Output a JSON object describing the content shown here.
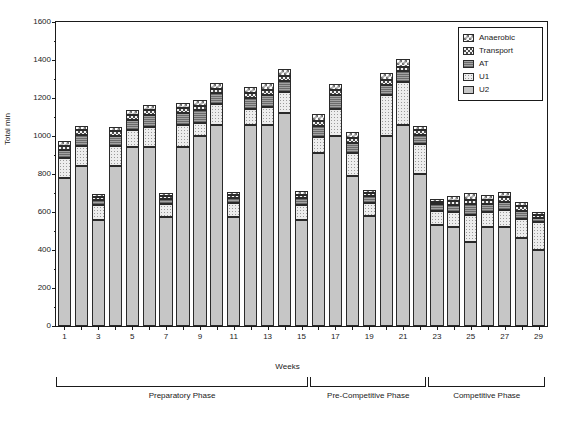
{
  "chart_data": {
    "type": "bar",
    "stacked": true,
    "title": "",
    "xlabel": "Weeks",
    "ylabel": "Total min",
    "ylim": [
      0,
      1600
    ],
    "ytick_step": 200,
    "yticks": [
      0,
      200,
      400,
      600,
      800,
      1000,
      1200,
      1400,
      1600
    ],
    "grid": false,
    "legend_position": "top-right",
    "categories": [
      1,
      2,
      3,
      4,
      5,
      6,
      7,
      8,
      9,
      10,
      11,
      12,
      13,
      14,
      15,
      16,
      17,
      18,
      19,
      20,
      21,
      22,
      23,
      24,
      25,
      26,
      27,
      28,
      29
    ],
    "xtick_labels": [
      "1",
      "3",
      "5",
      "7",
      "9",
      "11",
      "13",
      "15",
      "17",
      "19",
      "21",
      "23",
      "25",
      "27",
      "29"
    ],
    "series": [
      {
        "name": "U2",
        "values": [
          780,
          840,
          560,
          840,
          940,
          940,
          575,
          940,
          1000,
          1060,
          575,
          1060,
          1060,
          1120,
          560,
          910,
          1000,
          790,
          580,
          1000,
          1060,
          800,
          530,
          520,
          440,
          520,
          520,
          465,
          400
        ]
      },
      {
        "name": "U1",
        "values": [
          105,
          105,
          75,
          105,
          90,
          110,
          65,
          120,
          70,
          110,
          70,
          80,
          95,
          110,
          75,
          85,
          140,
          120,
          70,
          215,
          225,
          160,
          75,
          80,
          145,
          80,
          90,
          100,
          150
        ]
      },
      {
        "name": "AT",
        "values": [
          40,
          60,
          30,
          55,
          55,
          60,
          30,
          60,
          65,
          55,
          30,
          60,
          60,
          60,
          40,
          60,
          75,
          55,
          35,
          55,
          55,
          45,
          35,
          35,
          55,
          40,
          45,
          40,
          20
        ]
      },
      {
        "name": "Transport",
        "values": [
          25,
          25,
          15,
          25,
          25,
          25,
          15,
          25,
          25,
          25,
          15,
          25,
          25,
          25,
          15,
          25,
          25,
          25,
          15,
          25,
          25,
          25,
          15,
          25,
          25,
          25,
          25,
          25,
          15
        ]
      },
      {
        "name": "Anaerobic",
        "values": [
          25,
          25,
          15,
          25,
          25,
          30,
          15,
          30,
          30,
          30,
          15,
          35,
          40,
          40,
          20,
          35,
          35,
          30,
          15,
          35,
          40,
          25,
          15,
          25,
          35,
          25,
          25,
          25,
          15
        ]
      }
    ],
    "series_styles": {
      "U2": "plain-light-grey",
      "U1": "light-dotted",
      "AT": "dark-grey-hatch",
      "Transport": "dense-checker",
      "Anaerobic": "open-checker"
    }
  },
  "legend": {
    "items": [
      {
        "label": "Anaerobic",
        "swatch": "anaerobic"
      },
      {
        "label": "Transport",
        "swatch": "transport"
      },
      {
        "label": "AT",
        "swatch": "at"
      },
      {
        "label": "U1",
        "swatch": "u1"
      },
      {
        "label": "U2",
        "swatch": "u2"
      }
    ]
  },
  "phases": [
    {
      "label": "Preparatory Phase",
      "start_week": 1,
      "end_week": 15
    },
    {
      "label": "Pre-Competitive Phase",
      "start_week": 16,
      "end_week": 22
    },
    {
      "label": "Competitive Phase",
      "start_week": 23,
      "end_week": 29
    }
  ],
  "colors": {
    "axis": "#1a1a1a",
    "background": "#ffffff",
    "u2": "#c6c6c6",
    "u1": "#ededed",
    "at": "#8a8a8a",
    "transport": "#f2f2f2",
    "anaerobic": "#ffffff"
  }
}
